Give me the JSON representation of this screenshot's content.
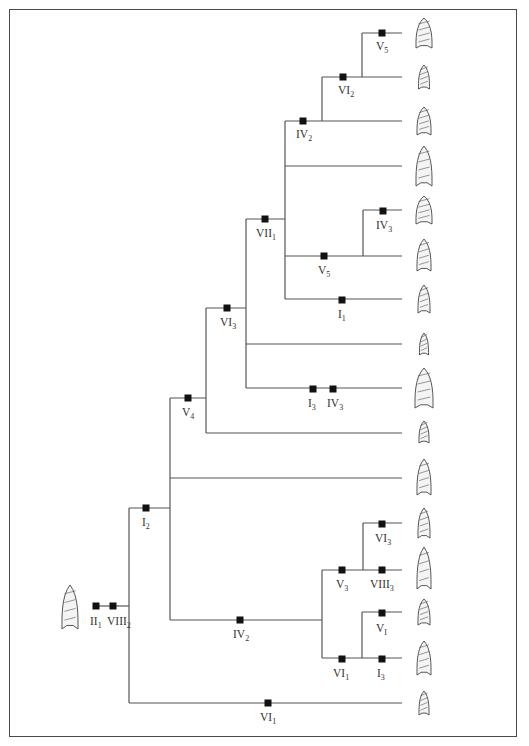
{
  "diagram": {
    "type": "cladogram",
    "colors": {
      "line": "#555555",
      "marker": "#111111",
      "frame": "#4a4a4a",
      "text": "#333333"
    },
    "outgroup": {
      "x": 70,
      "y": 607,
      "marks": [
        {
          "x": 96,
          "y": 606,
          "base": "II",
          "sub": "1"
        },
        {
          "x": 113,
          "y": 606,
          "base": "VIII",
          "sub": "2"
        }
      ]
    },
    "tips": [
      {
        "id": "t1",
        "y": 33
      },
      {
        "id": "t2",
        "y": 77
      },
      {
        "id": "t3",
        "y": 121
      },
      {
        "id": "t4",
        "y": 166
      },
      {
        "id": "t5",
        "y": 210
      },
      {
        "id": "t6",
        "y": 255
      },
      {
        "id": "t7",
        "y": 299
      },
      {
        "id": "t8",
        "y": 344
      },
      {
        "id": "t9",
        "y": 388
      },
      {
        "id": "t10",
        "y": 432
      },
      {
        "id": "t11",
        "y": 477
      },
      {
        "id": "t12",
        "y": 523
      },
      {
        "id": "t13",
        "y": 568
      },
      {
        "id": "t14",
        "y": 612
      },
      {
        "id": "t15",
        "y": 658
      },
      {
        "id": "t16",
        "y": 703
      }
    ],
    "branches": [
      "M118 606 H129",
      "M129 508 V703",
      "M129 703 H402",
      "M129 508 H170",
      "M170 398 V620",
      "M170 620 H322",
      "M170 478 H402",
      "M170 398 H206",
      "M206 308 V433",
      "M206 433 H402",
      "M206 308 H246",
      "M246 219 V388",
      "M246 388 H402",
      "M246 344 H402",
      "M246 219 H285",
      "M285 121 V299",
      "M285 299 H402",
      "M285 166 H402",
      "M285 256 H402",
      "M363 210 V256",
      "M363 210 H402",
      "M285 121 H322",
      "M322 77 V121",
      "M322 121 H402",
      "M322 77 H362",
      "M362 33 V77",
      "M362 77 H402",
      "M362 33 H402",
      "M322 570 V658",
      "M322 570 H402",
      "M322 658 H402",
      "M363 523 V570",
      "M363 523 H402",
      "M362 612 V658",
      "M362 612 H402"
    ],
    "marks": [
      {
        "x": 382,
        "y": 33,
        "base": "V",
        "sub": "5",
        "lx": 376,
        "ly": 50
      },
      {
        "x": 343,
        "y": 77,
        "base": "VI",
        "sub": "2",
        "lx": 338,
        "ly": 94
      },
      {
        "x": 303,
        "y": 121,
        "base": "IV",
        "sub": "2",
        "lx": 296,
        "ly": 138
      },
      {
        "x": 265,
        "y": 219,
        "base": "VII",
        "sub": "1",
        "lx": 256,
        "ly": 237
      },
      {
        "x": 383,
        "y": 211,
        "base": "IV",
        "sub": "3",
        "lx": 376,
        "ly": 229
      },
      {
        "x": 324,
        "y": 256,
        "base": "V",
        "sub": "5",
        "lx": 318,
        "ly": 274
      },
      {
        "x": 342,
        "y": 300,
        "base": "I",
        "sub": "1",
        "lx": 338,
        "ly": 318
      },
      {
        "x": 227,
        "y": 308,
        "base": "VI",
        "sub": "3",
        "lx": 220,
        "ly": 326
      },
      {
        "x": 313,
        "y": 389,
        "base": "I",
        "sub": "3",
        "lx": 308,
        "ly": 407
      },
      {
        "x": 333,
        "y": 389,
        "base": "IV",
        "sub": "3",
        "lx": 327,
        "ly": 407
      },
      {
        "x": 188,
        "y": 398,
        "base": "V",
        "sub": "4",
        "lx": 182,
        "ly": 416
      },
      {
        "x": 146,
        "y": 508,
        "base": "I",
        "sub": "2",
        "lx": 142,
        "ly": 526
      },
      {
        "x": 382,
        "y": 524,
        "base": "VI",
        "sub": "3",
        "lx": 375,
        "ly": 542
      },
      {
        "x": 342,
        "y": 570,
        "base": "V",
        "sub": "3",
        "lx": 336,
        "ly": 588
      },
      {
        "x": 382,
        "y": 570,
        "base": "VIII",
        "sub": "3",
        "lx": 370,
        "ly": 588
      },
      {
        "x": 240,
        "y": 620,
        "base": "IV",
        "sub": "2",
        "lx": 233,
        "ly": 638
      },
      {
        "x": 382,
        "y": 613,
        "base": "V",
        "sub": "I",
        "lx": 376,
        "ly": 632
      },
      {
        "x": 342,
        "y": 659,
        "base": "VI",
        "sub": "1",
        "lx": 333,
        "ly": 677
      },
      {
        "x": 382,
        "y": 659,
        "base": "I",
        "sub": "3",
        "lx": 377,
        "ly": 677
      },
      {
        "x": 268,
        "y": 703,
        "base": "VI",
        "sub": "1",
        "lx": 260,
        "ly": 721
      }
    ]
  }
}
